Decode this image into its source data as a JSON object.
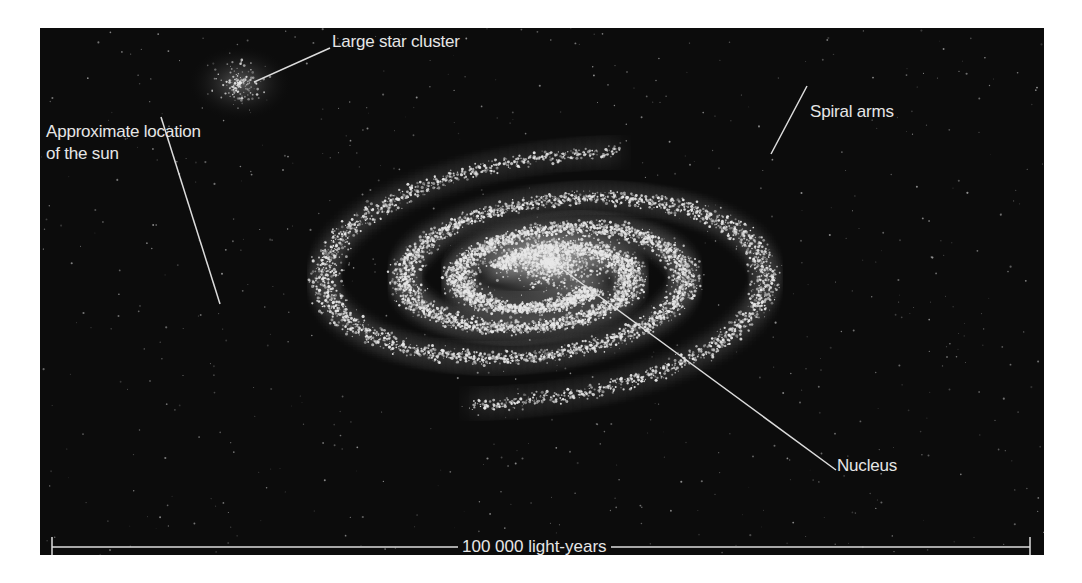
{
  "figure": {
    "colors": {
      "background": "#ffffff",
      "panel": "#0c0c0c",
      "stars": "#e8e8e8",
      "label_text": "#e6e6e6",
      "leader_lines": "#dcdcdc"
    }
  },
  "labels": {
    "large_star_cluster": "Large star cluster",
    "sun_location_line1": "Approximate location",
    "sun_location_line2": "of the sun",
    "spiral_arms": "Spiral arms",
    "nucleus": "Nucleus"
  },
  "scale_bar": {
    "label": "100 000 light-years",
    "x_start": 12,
    "x_end": 990,
    "y": 519
  },
  "leader_lines": [
    {
      "name": "large-star-cluster",
      "x1": 290,
      "y1": 20,
      "x2": 214,
      "y2": 54
    },
    {
      "name": "sun-location",
      "x1": 121,
      "y1": 89,
      "x2": 180,
      "y2": 276
    },
    {
      "name": "spiral-arms",
      "x1": 767,
      "y1": 58,
      "x2": 731,
      "y2": 126
    },
    {
      "name": "nucleus",
      "x1": 518,
      "y1": 238,
      "x2": 796,
      "y2": 442
    }
  ]
}
